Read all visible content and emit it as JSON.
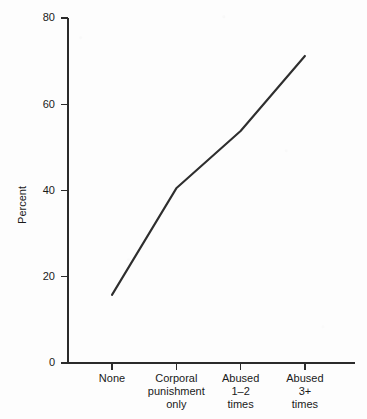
{
  "figure": {
    "title_faint": "",
    "background_color": "#fdfdfd",
    "line_color": "#2e2e2e",
    "axis_color": "#2b2b2b"
  },
  "chart_data": {
    "type": "line",
    "title": "",
    "xlabel": "",
    "ylabel": "Percent",
    "ylim": [
      0,
      80
    ],
    "yticks": [
      0,
      20,
      40,
      60,
      80
    ],
    "ytick_labels": [
      "0",
      "20",
      "40",
      "60",
      "80"
    ],
    "grid": false,
    "legend": false,
    "categories": [
      "None",
      "Corporal punishment only",
      "Abused 1–2 times",
      "Abused 3+ times"
    ],
    "category_lines": [
      [
        "None"
      ],
      [
        "Corporal",
        "punishment",
        "only"
      ],
      [
        "Abused",
        "1–2",
        "times"
      ],
      [
        "Abused",
        "3+",
        "times"
      ]
    ],
    "values": [
      15.8,
      40.5,
      53.8,
      71.2
    ],
    "series": [
      {
        "name": "Percent",
        "values": [
          15.8,
          40.5,
          53.8,
          71.2
        ]
      }
    ]
  }
}
